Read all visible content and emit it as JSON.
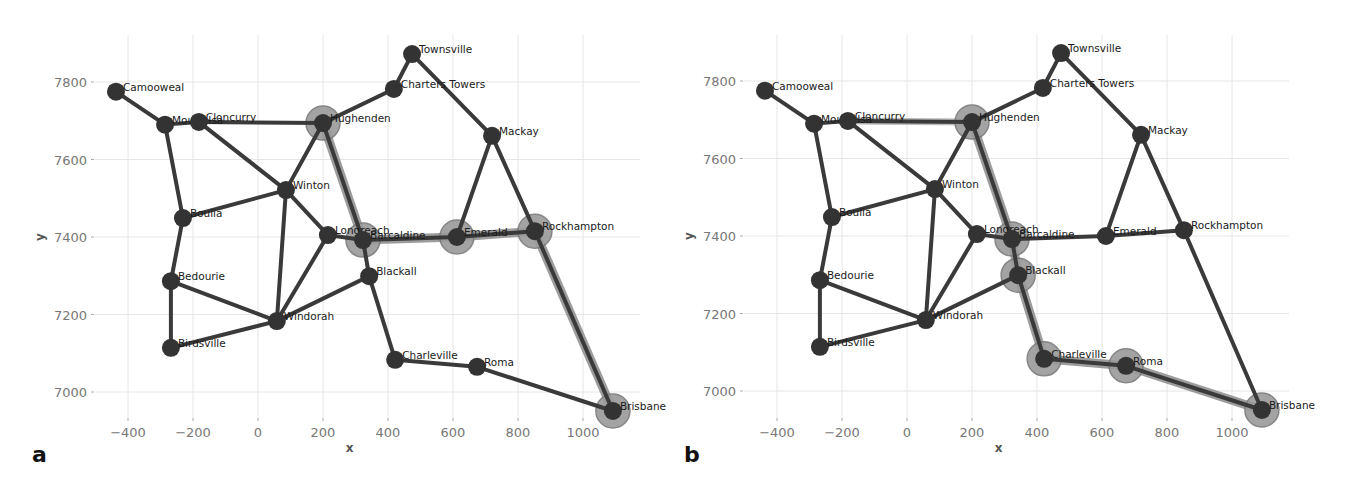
{
  "figure": {
    "panels": [
      {
        "letter": "a",
        "xlabel": "x",
        "ylabel": "y"
      },
      {
        "letter": "b",
        "xlabel": "x",
        "ylabel": "y"
      }
    ]
  },
  "chart_data": [
    {
      "type": "network",
      "panel": "a",
      "title": "",
      "xlabel": "x",
      "ylabel": "y",
      "xlim": [
        -480,
        1160
      ],
      "ylim": [
        6900,
        7915
      ],
      "xticks": [
        -400,
        -200,
        0,
        200,
        400,
        600,
        800,
        1000
      ],
      "yticks": [
        7000,
        7200,
        7400,
        7600,
        7800
      ],
      "grid": true,
      "nodes": [
        {
          "name": "Camooweal",
          "x": -437,
          "y": 7775
        },
        {
          "name": "Mount Isa",
          "x": -286,
          "y": 7690
        },
        {
          "name": "Cloncurry",
          "x": -182,
          "y": 7697
        },
        {
          "name": "Hughenden",
          "x": 200,
          "y": 7694
        },
        {
          "name": "Townsville",
          "x": 474,
          "y": 7872
        },
        {
          "name": "Charters Towers",
          "x": 418,
          "y": 7782
        },
        {
          "name": "Mackay",
          "x": 720,
          "y": 7661
        },
        {
          "name": "Winton",
          "x": 86,
          "y": 7521
        },
        {
          "name": "Boulia",
          "x": -231,
          "y": 7449
        },
        {
          "name": "Longreach",
          "x": 215,
          "y": 7405
        },
        {
          "name": "Barcaldine",
          "x": 323,
          "y": 7392
        },
        {
          "name": "Emerald",
          "x": 612,
          "y": 7400
        },
        {
          "name": "Rockhampton",
          "x": 852,
          "y": 7415
        },
        {
          "name": "Blackall",
          "x": 342,
          "y": 7299
        },
        {
          "name": "Bedourie",
          "x": -268,
          "y": 7286
        },
        {
          "name": "Windorah",
          "x": 58,
          "y": 7183
        },
        {
          "name": "Birdsville",
          "x": -268,
          "y": 7114
        },
        {
          "name": "Charleville",
          "x": 422,
          "y": 7083
        },
        {
          "name": "Roma",
          "x": 674,
          "y": 7065
        },
        {
          "name": "Brisbane",
          "x": 1092,
          "y": 6951
        }
      ],
      "edges": [
        [
          "Camooweal",
          "Mount Isa"
        ],
        [
          "Mount Isa",
          "Cloncurry"
        ],
        [
          "Cloncurry",
          "Hughenden"
        ],
        [
          "Mount Isa",
          "Boulia"
        ],
        [
          "Cloncurry",
          "Winton"
        ],
        [
          "Hughenden",
          "Charters Towers"
        ],
        [
          "Charters Towers",
          "Townsville"
        ],
        [
          "Townsville",
          "Mackay"
        ],
        [
          "Hughenden",
          "Winton"
        ],
        [
          "Hughenden",
          "Barcaldine"
        ],
        [
          "Winton",
          "Boulia"
        ],
        [
          "Winton",
          "Longreach"
        ],
        [
          "Winton",
          "Windorah"
        ],
        [
          "Boulia",
          "Bedourie"
        ],
        [
          "Bedourie",
          "Birdsville"
        ],
        [
          "Bedourie",
          "Windorah"
        ],
        [
          "Birdsville",
          "Windorah"
        ],
        [
          "Windorah",
          "Longreach"
        ],
        [
          "Windorah",
          "Blackall"
        ],
        [
          "Longreach",
          "Barcaldine"
        ],
        [
          "Barcaldine",
          "Emerald"
        ],
        [
          "Barcaldine",
          "Blackall"
        ],
        [
          "Emerald",
          "Mackay"
        ],
        [
          "Emerald",
          "Rockhampton"
        ],
        [
          "Mackay",
          "Rockhampton"
        ],
        [
          "Rockhampton",
          "Brisbane"
        ],
        [
          "Blackall",
          "Charleville"
        ],
        [
          "Charleville",
          "Roma"
        ],
        [
          "Roma",
          "Brisbane"
        ]
      ],
      "highlighted_path": [
        "Hughenden",
        "Barcaldine",
        "Emerald",
        "Rockhampton",
        "Brisbane"
      ]
    },
    {
      "type": "network",
      "panel": "b",
      "title": "",
      "xlabel": "x",
      "ylabel": "y",
      "xlim": [
        -480,
        1160
      ],
      "ylim": [
        6900,
        7915
      ],
      "xticks": [
        -400,
        -200,
        0,
        200,
        400,
        600,
        800,
        1000
      ],
      "yticks": [
        7000,
        7200,
        7400,
        7600,
        7800
      ],
      "grid": true,
      "nodes_same_as_panel": "a",
      "edges_same_as_panel": "a",
      "highlighted_path": [
        "Hughenden",
        "Barcaldine",
        "Blackall",
        "Charleville",
        "Roma",
        "Brisbane"
      ],
      "faint_highlight_edges": [
        [
          "Cloncurry",
          "Hughenden"
        ]
      ]
    }
  ],
  "colors": {
    "node": "#333333",
    "edge": "#3a3a3a",
    "path_highlight": "#8c8c8c",
    "grid": "#e6e6e6",
    "tick_text": "#777777"
  }
}
